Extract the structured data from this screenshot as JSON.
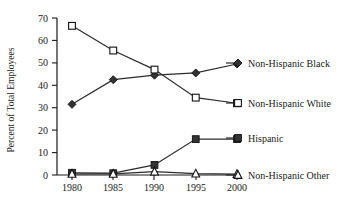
{
  "chart_data": {
    "type": "line",
    "title": "",
    "xlabel": "",
    "ylabel": "Percent of Total Employees",
    "x": [
      1980,
      1985,
      1990,
      1995,
      2000
    ],
    "xticklabels": [
      "1980",
      "1985",
      "1990",
      "1995",
      "2000"
    ],
    "yticklabels": [
      "0",
      "10",
      "20",
      "30",
      "40",
      "50",
      "60",
      "70"
    ],
    "yticks": [
      0,
      10,
      20,
      30,
      40,
      50,
      60,
      70
    ],
    "ylim": [
      0,
      70
    ],
    "xlim": [
      1978,
      2002
    ],
    "grid": false,
    "legend_position": "right-inline",
    "series": [
      {
        "name": "Non-Hispanic Black",
        "marker": "filled-diamond",
        "color": "#333333",
        "values": [
          31.5,
          42.5,
          44.5,
          45.5,
          49.5
        ]
      },
      {
        "name": "Non-Hispanic White",
        "marker": "open-square",
        "color": "#ffffff",
        "values": [
          66.5,
          55.5,
          47.0,
          34.5,
          32.0
        ]
      },
      {
        "name": "Hispanic",
        "marker": "filled-square",
        "color": "#333333",
        "values": [
          1.0,
          0.8,
          4.5,
          16.0,
          16.0
        ]
      },
      {
        "name": "Non-Hispanic Other",
        "marker": "open-triangle",
        "color": "#ffffff",
        "values": [
          0.5,
          0.5,
          1.5,
          0.6,
          0.4
        ]
      }
    ]
  },
  "legend": {
    "items": [
      {
        "label": "Non-Hispanic Black",
        "marker": "filled-diamond"
      },
      {
        "label": "Non-Hispanic White",
        "marker": "open-square"
      },
      {
        "label": "Hispanic",
        "marker": "filled-square"
      },
      {
        "label": "Non-Hispanic Other",
        "marker": "open-triangle"
      }
    ]
  },
  "axes": {
    "y_title": "Percent of Total Employees",
    "y_tick_0": "0",
    "y_tick_10": "10",
    "y_tick_20": "20",
    "y_tick_30": "30",
    "y_tick_40": "40",
    "y_tick_50": "50",
    "y_tick_60": "60",
    "y_tick_70": "70",
    "x_tick_1980": "1980",
    "x_tick_1985": "1985",
    "x_tick_1990": "1990",
    "x_tick_1995": "1995",
    "x_tick_2000": "2000"
  }
}
